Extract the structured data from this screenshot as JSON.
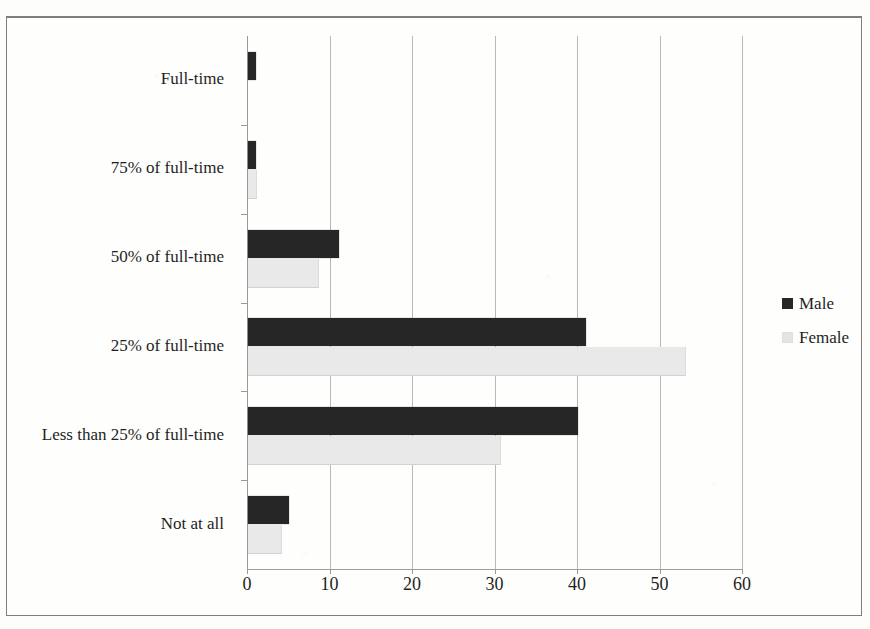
{
  "chart_data": {
    "type": "bar",
    "orientation": "horizontal",
    "title": "",
    "subtitle": "",
    "xlabel": "",
    "ylabel": "",
    "xlim": [
      0,
      60
    ],
    "xticks": [
      0,
      10,
      20,
      30,
      40,
      50,
      60
    ],
    "xtick_labels": [
      "0",
      "10",
      "20",
      "30",
      "40",
      "50",
      "60"
    ],
    "grid": "vertical",
    "legend_position": "right",
    "categories": [
      "Full-time",
      "75% of full-time",
      "50% of full-time",
      "25% of full-time",
      "Less than 25% of full-time",
      "Not at all"
    ],
    "series": [
      {
        "name": "Male",
        "color": "#262626",
        "values": [
          1,
          1,
          11,
          41,
          40,
          5
        ]
      },
      {
        "name": "Female",
        "color": "#e9e9e9",
        "values": [
          0,
          1,
          8.5,
          53,
          30.5,
          4
        ]
      }
    ]
  },
  "legend": {
    "items": [
      {
        "label": "Male",
        "marker": "square-dark"
      },
      {
        "label": "Female",
        "marker": "square-light"
      }
    ]
  }
}
